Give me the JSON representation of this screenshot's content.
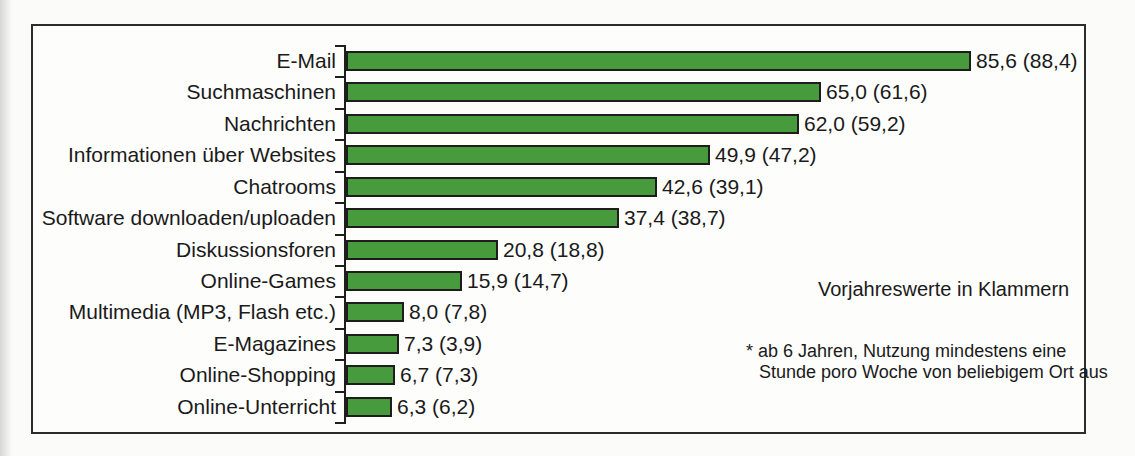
{
  "chart_data": {
    "type": "bar",
    "orientation": "horizontal",
    "title": "",
    "xlabel": "",
    "ylabel": "",
    "xlim": [
      0,
      100
    ],
    "grid": false,
    "legend_position": "none",
    "bar_color": "#489b3c",
    "bar_border_color": "#1d1d1b",
    "categories": [
      "E-Mail",
      "Suchmaschinen",
      "Nachrichten",
      "Informationen über Websites",
      "Chatrooms",
      "Software downloaden/uploaden",
      "Diskussionsforen",
      "Online-Games",
      "Multimedia (MP3, Flash etc.)",
      "E-Magazines",
      "Online-Shopping",
      "Online-Unterricht"
    ],
    "series": [
      {
        "name": "aktuelles Jahr",
        "values": [
          85.6,
          65.0,
          62.0,
          49.9,
          42.6,
          37.4,
          20.8,
          15.9,
          8.0,
          7.3,
          6.7,
          6.3
        ]
      },
      {
        "name": "Vorjahreswerte",
        "values": [
          88.4,
          61.6,
          59.2,
          47.2,
          39.1,
          38.7,
          18.8,
          14.7,
          7.8,
          3.9,
          7.3,
          6.2
        ]
      }
    ],
    "value_labels": [
      "85,6 (88,4)",
      "65,0 (61,6)",
      "62,0 (59,2)",
      "49,9 (47,2)",
      "42,6 (39,1)",
      "37,4 (38,7)",
      "20,8 (18,8)",
      "15,9 (14,7)",
      "8,0 (7,8)",
      "7,3 (3,9)",
      "6,7 (7,3)",
      "6,3 (6,2)"
    ]
  },
  "annotations": {
    "parens_note": "Vorjahreswerte in Klammern",
    "footnote_line1": "* ab 6 Jahren,  Nutzung mindestens eine",
    "footnote_line2": "Stunde poro Woche von beliebigem Ort aus"
  }
}
